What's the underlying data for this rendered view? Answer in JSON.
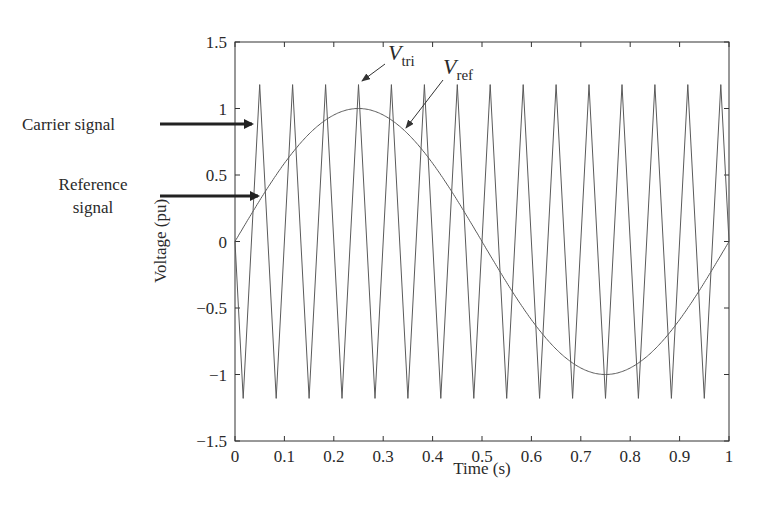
{
  "chart_data": {
    "type": "line",
    "title": "",
    "xlabel": "Time (s)",
    "ylabel": "Voltage (pu)",
    "xlim": [
      0,
      1
    ],
    "ylim": [
      -1.5,
      1.5
    ],
    "xticks": [
      "0",
      "0.1",
      "0.2",
      "0.3",
      "0.4",
      "0.5",
      "0.6",
      "0.7",
      "0.8",
      "0.9",
      "1"
    ],
    "yticks": [
      "1.5",
      "1",
      "0.5",
      "0",
      "-0.5",
      "-1",
      "-1.5"
    ],
    "grid": false,
    "series": [
      {
        "name": "V_tri",
        "description": "Carrier signal (triangle wave)",
        "kind": "triangle",
        "periods": 15,
        "amplitude": 1.18,
        "starts_at": 0,
        "initial_direction": "down",
        "color": "#555555"
      },
      {
        "name": "V_ref",
        "description": "Reference signal (sine wave)",
        "kind": "sine",
        "frequency_hz": 1,
        "amplitude": 1.0,
        "x": [
          0,
          0.125,
          0.25,
          0.375,
          0.5,
          0.625,
          0.75,
          0.875,
          1.0
        ],
        "values": [
          0,
          0.71,
          1.0,
          0.71,
          0,
          -0.71,
          -1.0,
          -0.71,
          0
        ],
        "color": "#555555"
      }
    ],
    "annotations": [
      {
        "text": "Carrier signal",
        "points_to": "V_tri",
        "y": 0.88
      },
      {
        "text": "Reference signal",
        "lines": [
          "Reference",
          "signal"
        ],
        "points_to": "V_ref",
        "y": 0.34
      },
      {
        "text": "V_tri",
        "main": "V",
        "sub": "tri",
        "points_to": "triangle peak near t=0.38"
      },
      {
        "text": "V_ref",
        "main": "V",
        "sub": "ref",
        "points_to": "sine near t=0.34"
      }
    ]
  },
  "labels": {
    "xlabel": "Time (s)",
    "ylabel": "Voltage (pu)",
    "carrier": "Carrier signal",
    "reference_line1": "Reference",
    "reference_line2": "signal",
    "vtri_main": "V",
    "vtri_sub": "tri",
    "vref_main": "V",
    "vref_sub": "ref"
  },
  "style": {
    "line_color": "#5a5a5a",
    "axis_color": "#333333",
    "arrow_color": "#222222"
  }
}
